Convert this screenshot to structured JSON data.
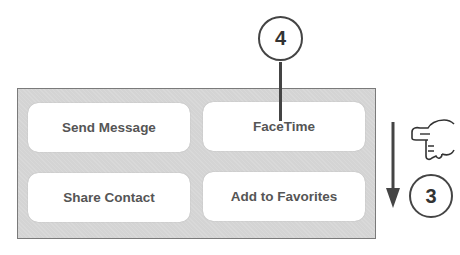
{
  "panel": {
    "buttons": [
      {
        "label": "Send Message"
      },
      {
        "label": "FaceTime"
      },
      {
        "label": "Share Contact"
      },
      {
        "label": "Add to Favorites"
      }
    ]
  },
  "callouts": [
    {
      "number": "4"
    },
    {
      "number": "3"
    }
  ],
  "annotations": {
    "arrow_icon": "down-arrow-icon",
    "hand_icon": "pointing-hand-icon"
  }
}
